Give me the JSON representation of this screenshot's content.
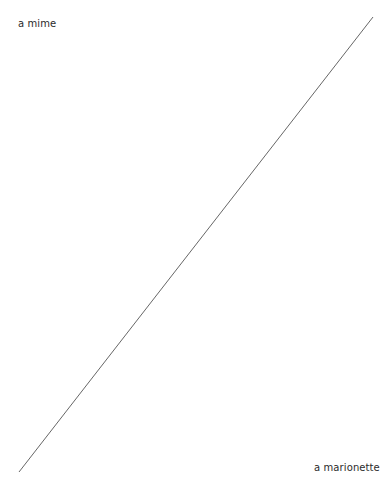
{
  "diagram": {
    "labels": {
      "top_left": "a mime",
      "bottom_right": "a marionette"
    },
    "line": {
      "x1": 373,
      "y1": 17,
      "x2": 19,
      "y2": 472,
      "color": "#555555"
    }
  }
}
